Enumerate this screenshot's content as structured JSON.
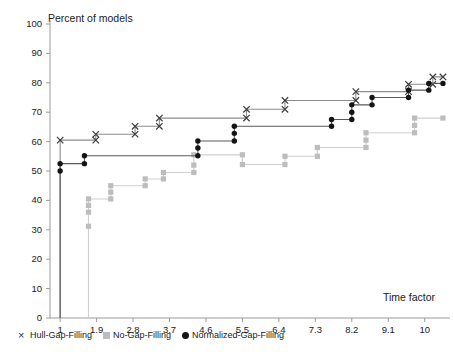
{
  "chart_data": {
    "type": "line",
    "title": "",
    "ylabel": "Percent of models",
    "xlabel": "Time factor",
    "xlim": [
      0.75,
      10.55
    ],
    "ylim": [
      0,
      100
    ],
    "xticks": [
      "1",
      "1.9",
      "2.8",
      "3.7",
      "4.6",
      "5.5",
      "6.4",
      "7.3",
      "8.2",
      "9.1",
      "10"
    ],
    "xtick_values": [
      1,
      1.9,
      2.8,
      3.7,
      4.6,
      5.5,
      6.4,
      7.3,
      8.2,
      9.1,
      10
    ],
    "yticks": [
      "0",
      "10",
      "20",
      "30",
      "40",
      "50",
      "60",
      "70",
      "80",
      "90",
      "100"
    ],
    "ytick_values": [
      0,
      10,
      20,
      30,
      40,
      50,
      60,
      70,
      80,
      90,
      100
    ],
    "grid": false,
    "legend_position": "below-axis-left",
    "step_style": "post",
    "series": [
      {
        "name": "Hull-Gap-Filling",
        "marker": "x",
        "color": "#3a3a3a",
        "line_color": "#8c8c8c",
        "points": [
          {
            "x": 1.0,
            "y": 0.0
          },
          {
            "x": 1.0,
            "y": 60.5
          },
          {
            "x": 1.88,
            "y": 60.5
          },
          {
            "x": 1.88,
            "y": 62.5
          },
          {
            "x": 2.85,
            "y": 62.5
          },
          {
            "x": 2.85,
            "y": 65.2
          },
          {
            "x": 3.45,
            "y": 65.2
          },
          {
            "x": 3.45,
            "y": 68.0
          },
          {
            "x": 5.6,
            "y": 68.0
          },
          {
            "x": 5.6,
            "y": 71.0
          },
          {
            "x": 6.55,
            "y": 71.0
          },
          {
            "x": 6.55,
            "y": 74.0
          },
          {
            "x": 8.3,
            "y": 74.0
          },
          {
            "x": 8.3,
            "y": 77.0
          },
          {
            "x": 9.6,
            "y": 77.0
          },
          {
            "x": 9.6,
            "y": 79.5
          },
          {
            "x": 10.2,
            "y": 79.5
          },
          {
            "x": 10.2,
            "y": 82.0
          },
          {
            "x": 10.45,
            "y": 82.0
          }
        ]
      },
      {
        "name": "No-Gap-Filling",
        "marker": "square",
        "color": "#bdbdbd",
        "line_color": "#cfcfcf",
        "points": [
          {
            "x": 1.0,
            "y": 0.0
          },
          {
            "x": 1.7,
            "y": 0.0
          },
          {
            "x": 1.7,
            "y": 31.2
          },
          {
            "x": 1.7,
            "y": 36.0
          },
          {
            "x": 1.7,
            "y": 38.3
          },
          {
            "x": 1.7,
            "y": 40.5
          },
          {
            "x": 2.25,
            "y": 40.5
          },
          {
            "x": 2.25,
            "y": 42.8
          },
          {
            "x": 2.25,
            "y": 45.0
          },
          {
            "x": 3.1,
            "y": 45.0
          },
          {
            "x": 3.1,
            "y": 47.3
          },
          {
            "x": 3.55,
            "y": 47.3
          },
          {
            "x": 3.55,
            "y": 49.5
          },
          {
            "x": 4.3,
            "y": 49.5
          },
          {
            "x": 4.3,
            "y": 52.0
          },
          {
            "x": 4.3,
            "y": 55.5
          },
          {
            "x": 5.5,
            "y": 55.5
          },
          {
            "x": 5.5,
            "y": 52.2
          },
          {
            "x": 6.55,
            "y": 52.2
          },
          {
            "x": 6.55,
            "y": 55.0
          },
          {
            "x": 7.35,
            "y": 55.0
          },
          {
            "x": 7.35,
            "y": 58.0
          },
          {
            "x": 8.55,
            "y": 58.0
          },
          {
            "x": 8.55,
            "y": 60.5
          },
          {
            "x": 8.55,
            "y": 63.0
          },
          {
            "x": 9.75,
            "y": 63.0
          },
          {
            "x": 9.75,
            "y": 65.5
          },
          {
            "x": 9.75,
            "y": 68.0
          },
          {
            "x": 10.45,
            "y": 68.0
          }
        ]
      },
      {
        "name": "Normalized-Gap-Filling",
        "marker": "circle",
        "color": "#141414",
        "line_color": "#5a5a5a",
        "points": [
          {
            "x": 1.0,
            "y": 0.0
          },
          {
            "x": 1.0,
            "y": 50.0
          },
          {
            "x": 1.0,
            "y": 52.5
          },
          {
            "x": 1.6,
            "y": 52.5
          },
          {
            "x": 1.6,
            "y": 55.2
          },
          {
            "x": 4.4,
            "y": 55.2
          },
          {
            "x": 4.4,
            "y": 57.8
          },
          {
            "x": 4.4,
            "y": 60.2
          },
          {
            "x": 5.3,
            "y": 60.2
          },
          {
            "x": 5.3,
            "y": 62.8
          },
          {
            "x": 5.3,
            "y": 65.2
          },
          {
            "x": 7.7,
            "y": 65.2
          },
          {
            "x": 7.7,
            "y": 67.5
          },
          {
            "x": 8.2,
            "y": 67.5
          },
          {
            "x": 8.2,
            "y": 70.0
          },
          {
            "x": 8.2,
            "y": 72.5
          },
          {
            "x": 8.7,
            "y": 72.5
          },
          {
            "x": 8.7,
            "y": 75.0
          },
          {
            "x": 9.6,
            "y": 75.0
          },
          {
            "x": 9.6,
            "y": 77.5
          },
          {
            "x": 10.1,
            "y": 77.5
          },
          {
            "x": 10.1,
            "y": 79.8
          },
          {
            "x": 10.45,
            "y": 79.8
          }
        ]
      }
    ]
  },
  "legend": {
    "items": [
      {
        "label": "Hull-Gap-Filling",
        "marker": "x"
      },
      {
        "label": "No-Gap-Filling",
        "marker": "square"
      },
      {
        "label": "Normalized-Gap-Filling",
        "marker": "circle"
      }
    ]
  }
}
